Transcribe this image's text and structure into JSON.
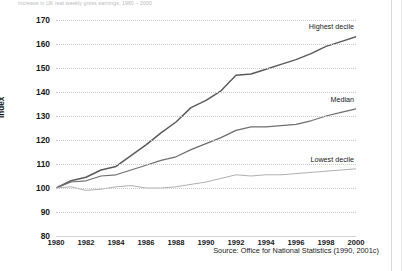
{
  "caption": "Increase in UK real weekly gross earnings, 1980 – 2000",
  "source_note": "Source: Office for National Statistics (1990, 2001c)",
  "axis": {
    "y_title": "Index",
    "y_ticks": [
      170,
      160,
      150,
      140,
      130,
      120,
      110,
      100,
      90,
      80
    ],
    "y_min": 80,
    "y_max": 170,
    "x_ticks": [
      1980,
      1982,
      1984,
      1986,
      1988,
      1990,
      1992,
      1994,
      1996,
      1998,
      2000
    ],
    "x_min": 1980,
    "x_max": 2000
  },
  "colors": {
    "highest": "#5b5b5b",
    "median": "#6e6e6e",
    "lowest": "#b0b0b0",
    "grid": "#c9c9cf",
    "text": "#1a1a1a"
  },
  "chart_data": {
    "type": "line",
    "title": "Increase in UK real weekly gross earnings, 1980 – 2000",
    "xlabel": "",
    "ylabel": "Index",
    "xlim": [
      1980,
      2000
    ],
    "ylim": [
      80,
      170
    ],
    "grid": true,
    "legend_position": "inline-right",
    "annotations": [
      "Highest decile",
      "Median",
      "Lowest decile"
    ],
    "x": [
      1980,
      1981,
      1982,
      1983,
      1984,
      1985,
      1986,
      1987,
      1988,
      1989,
      1990,
      1991,
      1992,
      1993,
      1994,
      1995,
      1996,
      1997,
      1998,
      1999,
      2000
    ],
    "series": [
      {
        "name": "Highest decile",
        "values": [
          100.0,
          103.0,
          104.5,
          107.5,
          109.0,
          113.5,
          118.0,
          123.0,
          127.5,
          133.5,
          136.5,
          140.5,
          147.0,
          147.5,
          149.5,
          151.5,
          153.5,
          156.0,
          159.0,
          161.0,
          163.0
        ]
      },
      {
        "name": "Median",
        "values": [
          100.0,
          102.5,
          103.0,
          105.0,
          105.5,
          107.5,
          109.5,
          111.5,
          113.0,
          116.0,
          118.5,
          121.0,
          124.0,
          125.5,
          125.5,
          126.0,
          126.5,
          128.0,
          130.0,
          131.5,
          133.0
        ]
      },
      {
        "name": "Lowest decile",
        "values": [
          100.0,
          100.5,
          99.0,
          99.5,
          100.5,
          101.0,
          100.0,
          100.0,
          100.5,
          101.5,
          102.5,
          104.0,
          105.5,
          105.0,
          105.5,
          105.5,
          106.0,
          106.5,
          107.0,
          107.5,
          108.0
        ]
      }
    ]
  }
}
